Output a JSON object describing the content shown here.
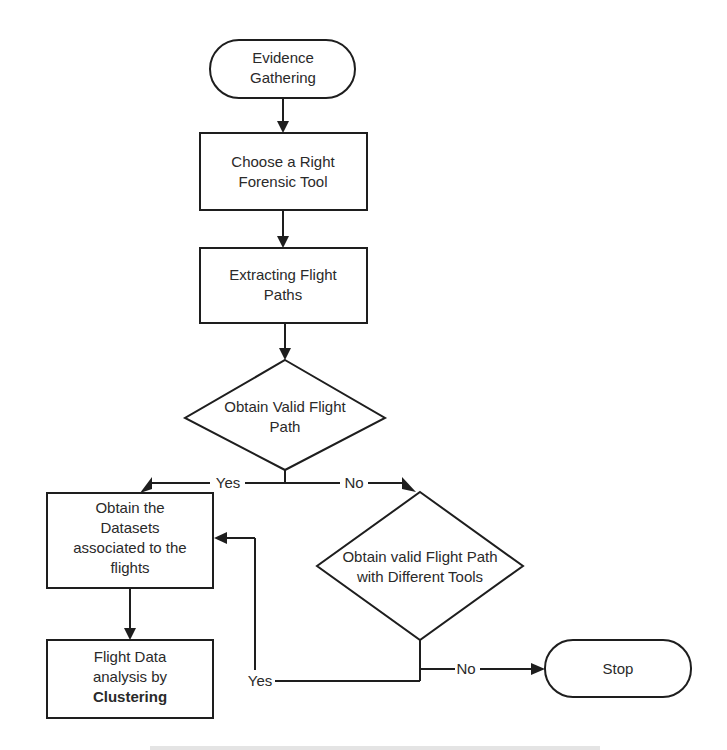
{
  "diagram": {
    "type": "flowchart",
    "nodes": {
      "start": {
        "kind": "terminal",
        "lines": [
          "Evidence",
          "Gathering"
        ]
      },
      "choose_tool": {
        "kind": "process",
        "lines": [
          "Choose a Right",
          "Forensic Tool"
        ]
      },
      "extract_paths": {
        "kind": "process",
        "lines": [
          "Extracting Flight",
          "Paths"
        ]
      },
      "valid_path_decision": {
        "kind": "decision",
        "lines": [
          "Obtain Valid Flight",
          "Path"
        ]
      },
      "obtain_datasets": {
        "kind": "process",
        "lines": [
          "Obtain the",
          "Datasets",
          "associated to the",
          "flights"
        ]
      },
      "different_tools_decision": {
        "kind": "decision",
        "lines": [
          "Obtain valid Flight Path",
          "with Different  Tools"
        ]
      },
      "analysis": {
        "kind": "process",
        "lines": [
          "Flight Data",
          "analysis by",
          "Clustering"
        ]
      },
      "stop": {
        "kind": "terminal",
        "lines": [
          "Stop"
        ]
      }
    },
    "edges": {
      "yes_1": {
        "from": "valid_path_decision",
        "to": "obtain_datasets",
        "label": "Yes"
      },
      "no_1": {
        "from": "valid_path_decision",
        "to": "different_tools_decision",
        "label": "No"
      },
      "yes_2": {
        "from": "different_tools_decision",
        "to": "obtain_datasets",
        "label": "Yes"
      },
      "no_2": {
        "from": "different_tools_decision",
        "to": "stop",
        "label": "No"
      }
    },
    "flow_order": [
      "start",
      "choose_tool",
      "extract_paths",
      "valid_path_decision",
      "obtain_datasets",
      "analysis"
    ]
  }
}
